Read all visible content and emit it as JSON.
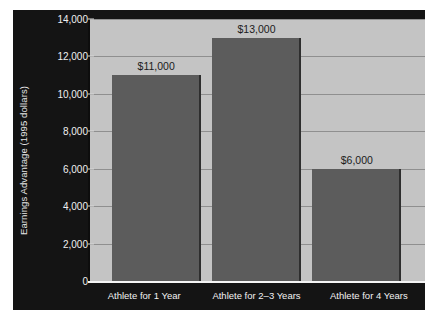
{
  "chart_data": {
    "type": "bar",
    "title": "",
    "xlabel": "",
    "ylabel": "Earnings Advantage (1995 dollars)",
    "categories": [
      "Athlete for 1 Year",
      "Athlete for 2–3 Years",
      "Athlete for 4 Years"
    ],
    "values": [
      11000,
      13000,
      6000
    ],
    "value_labels": [
      "$11,000",
      "$13,000",
      "$6,000"
    ],
    "ylim": [
      0,
      14000
    ],
    "ytick_values": [
      0,
      2000,
      4000,
      6000,
      8000,
      10000,
      12000,
      14000
    ],
    "ytick_labels": [
      "0",
      "2,000",
      "4,000",
      "6,000",
      "8,000",
      "10,000",
      "12,000",
      "14,000"
    ],
    "grid": true,
    "legend": "none",
    "colors": {
      "bar_fill": "#5c5c5c",
      "bar_edge": "#2e2e2e",
      "plot_background": "#c4c4c4",
      "figure_background": "#141414",
      "gridline": "#8f8f8f",
      "axis_text": "#f0f0f0",
      "data_label_text": "#1b1b1b",
      "baseline": "#f4f4f4"
    }
  }
}
